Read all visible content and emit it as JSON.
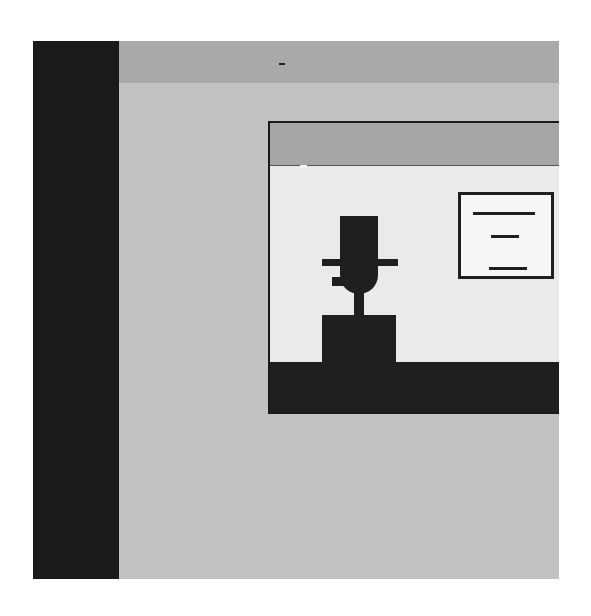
{
  "scene": {
    "description": "Stylized monochrome illustration of an application window containing a figure on a pedestal beside a sign panel",
    "colors": {
      "background": "#ffffff",
      "frame": "#c2c2c2",
      "sidebar": "#1a1a1a",
      "topbar": "#a9a9a9",
      "window_body": "#eaeaea",
      "window_title": "#a6a6a6",
      "ink": "#1f1f1f",
      "sign_fill": "#f6f6f6"
    },
    "sign": {
      "lines": 3
    }
  }
}
